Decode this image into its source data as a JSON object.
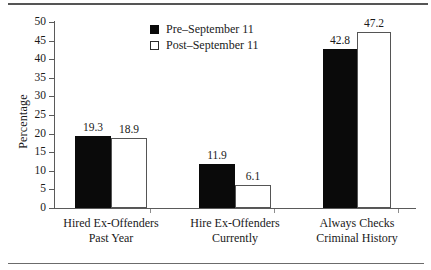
{
  "figure": {
    "has_top_rule": true,
    "has_bottom_rule": true,
    "rule_color": "#555555",
    "background": "#ffffff"
  },
  "legend": {
    "position": "top-center",
    "entries": [
      {
        "label": "Pre–September 11",
        "swatch": "filled-black-square",
        "color": "#0a0a0a"
      },
      {
        "label": "Post–September 11",
        "swatch": "open-white-square",
        "color": "#ffffff"
      }
    ]
  },
  "chart_data": {
    "type": "bar",
    "title": "",
    "subtitle": "",
    "xlabel": "",
    "ylabel": "Percentage",
    "ylim": [
      0,
      50
    ],
    "ytick_step": 5,
    "yticks": [
      "50",
      "45",
      "40",
      "35",
      "30",
      "25",
      "20",
      "15",
      "10",
      "5",
      "0"
    ],
    "grid": false,
    "categories": [
      "Hired Ex-Offenders\nPast Year",
      "Hire Ex-Offenders\nCurrently",
      "Always Checks\nCriminal History"
    ],
    "category_lines": [
      [
        "Hired Ex-Offenders",
        "Past Year"
      ],
      [
        "Hire Ex-Offenders",
        "Currently"
      ],
      [
        "Always Checks",
        "Criminal History"
      ]
    ],
    "series": [
      {
        "name": "Pre–September 11",
        "color": "#0a0a0a",
        "values": [
          19.3,
          11.9,
          42.8
        ],
        "value_labels": [
          "19.3",
          "11.9",
          "42.8"
        ]
      },
      {
        "name": "Post–September 11",
        "color": "#ffffff",
        "values": [
          18.9,
          6.1,
          47.2
        ],
        "value_labels": [
          "18.9",
          "6.1",
          "47.2"
        ]
      }
    ]
  }
}
